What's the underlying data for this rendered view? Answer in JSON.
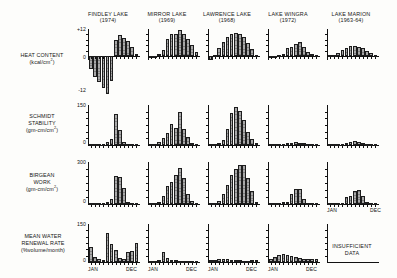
{
  "figure": {
    "columns": [
      {
        "name": "FINDLEY LAKE",
        "year": "(1974)"
      },
      {
        "name": "MIRROR LAKE",
        "year": "(1969)"
      },
      {
        "name": "LAWRENCE LAKE",
        "year": "(1968)"
      },
      {
        "name": "LAKE WINGRA",
        "year": "(1972)"
      },
      {
        "name": "LAKE MARION",
        "year": "(1963-64)"
      }
    ],
    "rows": [
      {
        "name": "HEAT CONTENT",
        "unit_pre": "(kcal/cm",
        "unit_sup": "2",
        "unit_post": ")"
      },
      {
        "name_line1": "SCHMIDT",
        "name_line2": "STABILITY",
        "unit_pre": "(gm-cm/cm",
        "unit_sup": "2",
        "unit_post": ")"
      },
      {
        "name_line1": "BIRGEAN",
        "name_line2": "WORK",
        "unit_pre": "(gm-cm/cm",
        "unit_sup": "2",
        "unit_post": ")"
      },
      {
        "name_line1": "MEAN WATER",
        "name_line2": "RENEWAL RATE",
        "unit_pre": "(%volume/month",
        "unit_sup": "",
        "unit_post": ")"
      }
    ],
    "axis_labels": {
      "jan": "JAN",
      "dec": "DEC"
    },
    "no_data_note": {
      "line1": "INSUFFICIENT",
      "line2": "DATA"
    },
    "colors": {
      "bar_fill": "#a9a9a9",
      "bar_stroke": "#1d1d1d",
      "axis": "#111111",
      "text": "#151515",
      "background": "#fdfdfb"
    }
  },
  "chart_data": [
    {
      "type": "bar",
      "title": "HEAT CONTENT — FINDLEY LAKE (1974)",
      "ylabel": "kcal/cm2",
      "ylim": [
        -18,
        12
      ],
      "yticks": [
        -12,
        0,
        12
      ],
      "ytick_labels": [
        "-12",
        "0",
        "+12"
      ],
      "categories": [
        "JAN",
        "FEB",
        "MAR",
        "APR",
        "MAY",
        "JUN",
        "JUL",
        "AUG",
        "SEP",
        "OCT",
        "NOV",
        "DEC"
      ],
      "values": [
        -5.5,
        -9.0,
        -11.5,
        -14.0,
        -16.5,
        -11.0,
        7.0,
        9.5,
        8.0,
        6.5,
        4.0,
        0.8
      ],
      "grid": false
    },
    {
      "type": "bar",
      "title": "HEAT CONTENT — MIRROR LAKE (1969)",
      "ylabel": "kcal/cm2",
      "ylim": [
        -3,
        12
      ],
      "yticks": [
        -12,
        0,
        12
      ],
      "ytick_labels": [
        "-12",
        "0",
        "+12"
      ],
      "categories": [
        "JAN",
        "FEB",
        "MAR",
        "APR",
        "MAY",
        "JUN",
        "JUL",
        "AUG",
        "SEP",
        "OCT",
        "NOV",
        "DEC"
      ],
      "values": [
        -0.6,
        -0.6,
        0.8,
        2.6,
        7.6,
        9.6,
        10.0,
        11.4,
        9.6,
        7.4,
        5.0,
        1.6
      ],
      "grid": false
    },
    {
      "type": "bar",
      "title": "HEAT CONTENT — LAWRENCE LAKE (1968)",
      "ylabel": "kcal/cm2",
      "ylim": [
        -3,
        12
      ],
      "yticks": [
        -12,
        0,
        12
      ],
      "ytick_labels": [
        "-12",
        "0",
        "+12"
      ],
      "categories": [
        "JAN",
        "FEB",
        "MAR",
        "APR",
        "MAY",
        "JUN",
        "JUL",
        "AUG",
        "SEP",
        "OCT",
        "NOV",
        "DEC"
      ],
      "values": [
        -1.8,
        0.5,
        3.6,
        6.2,
        8.6,
        9.8,
        10.2,
        10.0,
        8.4,
        6.0,
        3.0,
        0.5
      ],
      "grid": false
    },
    {
      "type": "bar",
      "title": "HEAT CONTENT — LAKE WINGRA (1972)",
      "ylabel": "kcal/cm2",
      "ylim": [
        -3,
        12
      ],
      "yticks": [
        -12,
        0,
        12
      ],
      "ytick_labels": [
        "-12",
        "0",
        "+12"
      ],
      "categories": [
        "JAN",
        "FEB",
        "MAR",
        "APR",
        "MAY",
        "JUN",
        "JUL",
        "AUG",
        "SEP",
        "OCT",
        "NOV",
        "DEC"
      ],
      "values": [
        -0.8,
        -1.0,
        0.6,
        1.0,
        3.6,
        4.2,
        5.2,
        6.4,
        4.0,
        2.0,
        0.8,
        0.4
      ],
      "grid": false
    },
    {
      "type": "bar",
      "title": "HEAT CONTENT — LAKE MARION (1963-64)",
      "ylabel": "kcal/cm2",
      "ylim": [
        -1,
        12
      ],
      "yticks": [
        -12,
        0,
        12
      ],
      "ytick_labels": [
        "-12",
        "0",
        "+12"
      ],
      "categories": [
        "JAN",
        "FEB",
        "MAR",
        "APR",
        "MAY",
        "JUN",
        "JUL",
        "AUG",
        "SEP",
        "OCT",
        "NOV",
        "DEC"
      ],
      "values": [
        0.2,
        0.4,
        1.4,
        2.6,
        3.6,
        4.4,
        4.6,
        4.2,
        3.4,
        2.2,
        1.2,
        0.4
      ],
      "grid": false
    },
    {
      "type": "bar",
      "title": "SCHMIDT STABILITY — FINDLEY LAKE (1974)",
      "ylabel": "gm-cm/cm2",
      "ylim": [
        0,
        150
      ],
      "yticks": [
        0,
        150
      ],
      "ytick_labels": [
        "0",
        "150"
      ],
      "categories": [
        "JAN",
        "FEB",
        "MAR",
        "APR",
        "MAY",
        "JUN",
        "JUL",
        "AUG",
        "SEP",
        "OCT",
        "NOV",
        "DEC"
      ],
      "values": [
        2,
        2,
        3,
        4,
        10,
        22,
        120,
        58,
        12,
        5,
        3,
        2
      ],
      "grid": false
    },
    {
      "type": "bar",
      "title": "SCHMIDT STABILITY — MIRROR LAKE (1969)",
      "ylabel": "gm-cm/cm2",
      "ylim": [
        0,
        150
      ],
      "yticks": [
        0,
        150
      ],
      "ytick_labels": [
        "0",
        "150"
      ],
      "categories": [
        "JAN",
        "FEB",
        "MAR",
        "APR",
        "MAY",
        "JUN",
        "JUL",
        "AUG",
        "SEP",
        "OCT",
        "NOV",
        "DEC"
      ],
      "values": [
        3,
        5,
        10,
        28,
        48,
        82,
        66,
        128,
        62,
        30,
        8,
        3
      ],
      "grid": false
    },
    {
      "type": "bar",
      "title": "SCHMIDT STABILITY — LAWRENCE LAKE (1968)",
      "ylabel": "gm-cm/cm2",
      "ylim": [
        0,
        150
      ],
      "yticks": [
        0,
        150
      ],
      "ytick_labels": [
        "0",
        "150"
      ],
      "categories": [
        "JAN",
        "FEB",
        "MAR",
        "APR",
        "MAY",
        "JUN",
        "JUL",
        "AUG",
        "SEP",
        "OCT",
        "NOV",
        "DEC"
      ],
      "values": [
        4,
        5,
        8,
        18,
        62,
        125,
        148,
        132,
        98,
        52,
        22,
        8
      ],
      "grid": false
    },
    {
      "type": "bar",
      "title": "SCHMIDT STABILITY — LAKE WINGRA (1972)",
      "ylabel": "gm-cm/cm2",
      "ylim": [
        0,
        150
      ],
      "yticks": [
        0,
        150
      ],
      "ytick_labels": [
        "0",
        "150"
      ],
      "categories": [
        "JAN",
        "FEB",
        "MAR",
        "APR",
        "MAY",
        "JUN",
        "JUL",
        "AUG",
        "SEP",
        "OCT",
        "NOV",
        "DEC"
      ],
      "values": [
        2,
        2,
        3,
        5,
        8,
        9,
        10,
        8,
        6,
        4,
        3,
        2
      ],
      "grid": false
    },
    {
      "type": "bar",
      "title": "SCHMIDT STABILITY — LAKE MARION (1963-64)",
      "ylabel": "gm-cm/cm2",
      "ylim": [
        0,
        150
      ],
      "yticks": [
        0,
        150
      ],
      "ytick_labels": [
        "0",
        "150"
      ],
      "categories": [
        "JAN",
        "FEB",
        "MAR",
        "APR",
        "MAY",
        "JUN",
        "JUL",
        "AUG",
        "SEP",
        "OCT",
        "NOV",
        "DEC"
      ],
      "values": [
        2,
        2,
        3,
        5,
        9,
        13,
        14,
        12,
        8,
        5,
        3,
        2
      ],
      "grid": false
    },
    {
      "type": "bar",
      "title": "BIRGEAN WORK — FINDLEY LAKE (1974)",
      "ylabel": "gm-cm/cm2",
      "ylim": [
        0,
        300
      ],
      "yticks": [
        0,
        300
      ],
      "ytick_labels": [
        "0",
        "300"
      ],
      "categories": [
        "JAN",
        "FEB",
        "MAR",
        "APR",
        "MAY",
        "JUN",
        "JUL",
        "AUG",
        "SEP",
        "OCT",
        "NOV",
        "DEC"
      ],
      "values": [
        4,
        4,
        6,
        8,
        14,
        40,
        205,
        200,
        120,
        18,
        8,
        5
      ],
      "grid": false
    },
    {
      "type": "bar",
      "title": "BIRGEAN WORK — MIRROR LAKE (1969)",
      "ylabel": "gm-cm/cm2",
      "ylim": [
        0,
        300
      ],
      "yticks": [
        0,
        300
      ],
      "ytick_labels": [
        "0",
        "300"
      ],
      "categories": [
        "JAN",
        "FEB",
        "MAR",
        "APR",
        "MAY",
        "JUN",
        "JUL",
        "AUG",
        "SEP",
        "OCT",
        "NOV",
        "DEC"
      ],
      "values": [
        5,
        8,
        15,
        62,
        130,
        165,
        215,
        265,
        195,
        70,
        20,
        8
      ],
      "grid": false
    },
    {
      "type": "bar",
      "title": "BIRGEAN WORK — LAWRENCE LAKE (1968)",
      "ylabel": "gm-cm/cm2",
      "ylim": [
        0,
        300
      ],
      "yticks": [
        0,
        300
      ],
      "ytick_labels": [
        "0",
        "300"
      ],
      "categories": [
        "JAN",
        "FEB",
        "MAR",
        "APR",
        "MAY",
        "JUN",
        "JUL",
        "AUG",
        "SEP",
        "OCT",
        "NOV",
        "DEC"
      ],
      "values": [
        6,
        10,
        25,
        75,
        140,
        210,
        260,
        290,
        285,
        190,
        95,
        12
      ],
      "grid": false
    },
    {
      "type": "bar",
      "title": "BIRGEAN WORK — LAKE WINGRA (1972)",
      "ylabel": "gm-cm/cm2",
      "ylim": [
        0,
        300
      ],
      "yticks": [
        0,
        300
      ],
      "ytick_labels": [
        "0",
        "300"
      ],
      "categories": [
        "JAN",
        "FEB",
        "MAR",
        "APR",
        "MAY",
        "JUN",
        "JUL",
        "AUG",
        "SEP",
        "OCT",
        "NOV",
        "DEC"
      ],
      "values": [
        2,
        3,
        5,
        12,
        18,
        72,
        110,
        112,
        38,
        10,
        5,
        3
      ],
      "grid": false
    },
    {
      "type": "bar",
      "title": "BIRGEAN WORK — LAKE MARION (1963-64)",
      "ylabel": "gm-cm/cm2",
      "ylim": [
        0,
        300
      ],
      "yticks": [
        0,
        300
      ],
      "ytick_labels": [
        "0",
        "300"
      ],
      "categories": [
        "JAN",
        "FEB",
        "MAR",
        "APR",
        "MAY",
        "JUN",
        "JUL",
        "AUG",
        "SEP",
        "OCT",
        "NOV",
        "DEC"
      ],
      "values": [
        3,
        4,
        6,
        10,
        55,
        62,
        95,
        105,
        60,
        12,
        6,
        4
      ],
      "grid": false
    },
    {
      "type": "bar",
      "title": "MEAN WATER RENEWAL RATE — FINDLEY LAKE (1974)",
      "ylabel": "%volume/month",
      "ylim": [
        0,
        150
      ],
      "yticks": [
        0,
        150
      ],
      "ytick_labels": [
        "0",
        "150"
      ],
      "categories": [
        "JAN",
        "FEB",
        "MAR",
        "APR",
        "MAY",
        "JUN",
        "JUL",
        "AUG",
        "SEP",
        "OCT",
        "NOV",
        "DEC"
      ],
      "values": [
        62,
        20,
        12,
        10,
        118,
        72,
        50,
        18,
        12,
        40,
        45,
        78
      ],
      "grid": false
    },
    {
      "type": "bar",
      "title": "MEAN WATER RENEWAL RATE — MIRROR LAKE (1969)",
      "ylabel": "%volume/month",
      "ylim": [
        0,
        150
      ],
      "yticks": [
        0,
        150
      ],
      "ytick_labels": [
        "0",
        "150"
      ],
      "categories": [
        "JAN",
        "FEB",
        "MAR",
        "APR",
        "MAY",
        "JUN",
        "JUL",
        "AUG",
        "SEP",
        "OCT",
        "NOV",
        "DEC"
      ],
      "values": [
        4,
        6,
        8,
        42,
        16,
        10,
        8,
        6,
        5,
        4,
        4,
        3
      ],
      "grid": false
    },
    {
      "type": "bar",
      "title": "MEAN WATER RENEWAL RATE — LAWRENCE LAKE (1968)",
      "ylabel": "%volume/month",
      "ylim": [
        0,
        150
      ],
      "yticks": [
        0,
        150
      ],
      "ytick_labels": [
        "0",
        "150"
      ],
      "categories": [
        "JAN",
        "FEB",
        "MAR",
        "APR",
        "MAY",
        "JUN",
        "JUL",
        "AUG",
        "SEP",
        "OCT",
        "NOV",
        "DEC"
      ],
      "values": [
        9,
        10,
        12,
        14,
        12,
        10,
        8,
        7,
        6,
        6,
        8,
        10
      ],
      "grid": false
    },
    {
      "type": "bar",
      "title": "MEAN WATER RENEWAL RATE — LAKE WINGRA (1972)",
      "ylabel": "%volume/month",
      "ylim": [
        0,
        150
      ],
      "yticks": [
        0,
        150
      ],
      "ytick_labels": [
        "0",
        "150"
      ],
      "categories": [
        "JAN",
        "FEB",
        "MAR",
        "APR",
        "MAY",
        "JUN",
        "JUL",
        "AUG",
        "SEP",
        "OCT",
        "NOV",
        "DEC"
      ],
      "values": [
        14,
        22,
        30,
        32,
        30,
        24,
        20,
        16,
        13,
        12,
        12,
        11
      ],
      "grid": false
    },
    {
      "type": "bar",
      "title": "MEAN WATER RENEWAL RATE — LAKE MARION (1963-64)",
      "ylabel": "%volume/month",
      "ylim": [
        0,
        150
      ],
      "yticks": [
        0,
        150
      ],
      "ytick_labels": [
        "0",
        "150"
      ],
      "categories": [],
      "values": [],
      "note": "INSUFFICIENT DATA",
      "grid": false
    }
  ]
}
